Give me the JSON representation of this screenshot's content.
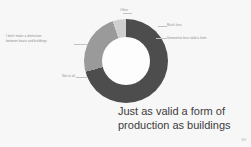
{
  "slide": {
    "background_color": "#f7f7f7",
    "page_number": "69"
  },
  "caption": {
    "line1": "Just as valid a form of",
    "line2": "production as buildings"
  },
  "labels": {
    "other": "Other",
    "left": "I don't make a distinction\nbetween boats and buildings",
    "bottom_left": "Not at all",
    "right_1": "Much less",
    "right_2": "Somewhat less valid a form"
  },
  "chart_data": {
    "type": "pie",
    "title": "Just as valid a form of production as buildings",
    "subtype": "donut",
    "hole_ratio": 0.57,
    "legend": "none",
    "labels_position": "callout",
    "categories": [
      "Just as valid a form of production as buildings",
      "I don't make a distinction between boats and buildings",
      "Other",
      "Somewhat less valid a form",
      "Much less",
      "Not at all"
    ],
    "values": [
      38,
      24,
      14,
      9,
      6,
      9
    ],
    "colors": [
      "#4d4d4d",
      "#9a9a9a",
      "#cfcfcf",
      "#8f8f8f",
      "#3f3f3f",
      "#b9b9b9"
    ]
  }
}
